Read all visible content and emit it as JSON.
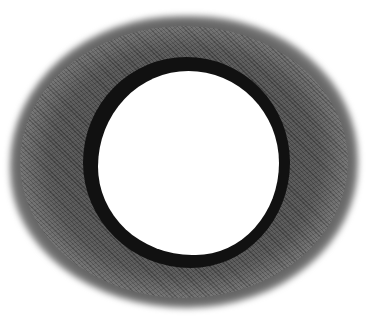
{
  "image": {
    "subject": "dark ring with soft gray halo",
    "colors": {
      "background": "#ffffff",
      "ring": "#111111",
      "halo": "#4a4a4a",
      "interior": "#ffffff"
    }
  }
}
